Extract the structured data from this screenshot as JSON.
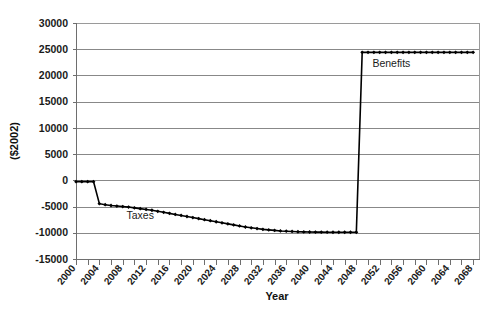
{
  "chart_data": {
    "type": "line",
    "title": "",
    "xlabel": "Year",
    "ylabel": "($2002)",
    "xlim": [
      2000,
      2069
    ],
    "ylim": [
      -15000,
      30000
    ],
    "ytick_step": 5000,
    "xtick_step": 2,
    "xlabel_step": 4,
    "grid": true,
    "legend_position": "inline-annotation",
    "ytick_labels": [
      "30000",
      "25000",
      "20000",
      "15000",
      "10000",
      "5000",
      "0",
      "-5000",
      "-10000",
      "-15000"
    ],
    "ytick_values": [
      30000,
      25000,
      20000,
      15000,
      10000,
      5000,
      0,
      -5000,
      -10000,
      -15000
    ],
    "xtick_labels": [
      "2000",
      "2004",
      "2008",
      "2012",
      "2016",
      "2020",
      "2024",
      "2028",
      "2032",
      "2036",
      "2040",
      "2044",
      "2048",
      "2052",
      "2056",
      "2060",
      "2064",
      "2068"
    ],
    "xtick_values": [
      2000,
      2004,
      2008,
      2012,
      2016,
      2020,
      2024,
      2028,
      2032,
      2036,
      2040,
      2044,
      2048,
      2052,
      2056,
      2060,
      2064,
      2068
    ],
    "annotations": [
      {
        "text": "Taxes",
        "x": 2011,
        "y": -7300
      },
      {
        "text": "Benefits",
        "x": 2054,
        "y": 21600
      }
    ],
    "series": [
      {
        "name": "Taxes and Benefits",
        "color": "#000000",
        "marker": "diamond",
        "x": [
          2000,
          2001,
          2002,
          2003,
          2004,
          2005,
          2006,
          2007,
          2008,
          2009,
          2010,
          2011,
          2012,
          2013,
          2014,
          2015,
          2016,
          2017,
          2018,
          2019,
          2020,
          2021,
          2022,
          2023,
          2024,
          2025,
          2026,
          2027,
          2028,
          2029,
          2030,
          2031,
          2032,
          2033,
          2034,
          2035,
          2036,
          2037,
          2038,
          2039,
          2040,
          2041,
          2042,
          2043,
          2044,
          2045,
          2046,
          2047,
          2048,
          2049,
          2050,
          2051,
          2052,
          2053,
          2054,
          2055,
          2056,
          2057,
          2058,
          2059,
          2060,
          2061,
          2062,
          2063,
          2064,
          2065,
          2066,
          2067,
          2068
        ],
        "values": [
          -250,
          -250,
          -250,
          -250,
          -4450,
          -4650,
          -4800,
          -4900,
          -5000,
          -5100,
          -5250,
          -5400,
          -5550,
          -5700,
          -5900,
          -6100,
          -6300,
          -6500,
          -6700,
          -6900,
          -7100,
          -7300,
          -7500,
          -7700,
          -7900,
          -8100,
          -8300,
          -8500,
          -8700,
          -8900,
          -9050,
          -9200,
          -9350,
          -9450,
          -9550,
          -9650,
          -9700,
          -9750,
          -9800,
          -9830,
          -9850,
          -9870,
          -9880,
          -9890,
          -9900,
          -9900,
          -9900,
          -9900,
          -9900,
          24400,
          24400,
          24400,
          24400,
          24400,
          24400,
          24400,
          24400,
          24400,
          24400,
          24400,
          24400,
          24400,
          24400,
          24400,
          24400,
          24400,
          24400,
          24400,
          24400
        ]
      }
    ]
  },
  "plot_geometry": {
    "left": 76,
    "right": 479,
    "top": 23,
    "bottom": 259
  }
}
